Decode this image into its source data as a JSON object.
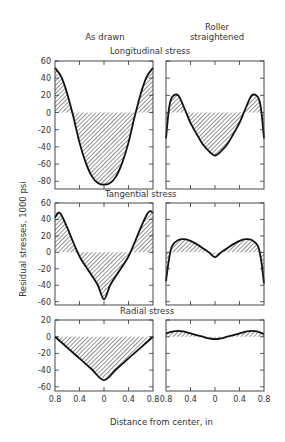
{
  "headers": {
    "left_column": "As drawn",
    "right_column_line1": "Roller",
    "right_column_line2": "straightened"
  },
  "xlabel": "Distance from center, in",
  "ylabel": "Residual stresses, 1000 psi",
  "colors": {
    "line": "#111111",
    "hatch": "#555555",
    "frame": "#333333",
    "text": "#333333"
  },
  "chart_data": {
    "type": "line",
    "title": "",
    "xlabel": "Distance from center, in",
    "ylabel": "Residual stresses, 1000 psi",
    "x_ticks": [
      "0.8",
      "0.4",
      "0",
      "0.4",
      "0.8"
    ],
    "x": [
      -0.8,
      -0.6,
      -0.4,
      -0.2,
      0,
      0.2,
      0.4,
      0.6,
      0.8
    ],
    "columns": [
      "As drawn",
      "Roller straightened"
    ],
    "panels": [
      {
        "title": "Longitudinal stress",
        "ylim": [
          -90,
          60
        ],
        "yticks": [
          60,
          40,
          20,
          0,
          -20,
          -40,
          -60,
          -80
        ],
        "series": [
          {
            "name": "As drawn",
            "x": [
              -0.8,
              -0.7,
              -0.6,
              -0.5,
              -0.4,
              -0.3,
              -0.2,
              -0.1,
              0,
              0.1,
              0.2,
              0.3,
              0.4,
              0.5,
              0.6,
              0.7,
              0.8
            ],
            "values": [
              52,
              42,
              22,
              -5,
              -35,
              -58,
              -74,
              -82,
              -84,
              -82,
              -74,
              -58,
              -35,
              -5,
              22,
              42,
              52
            ]
          },
          {
            "name": "Roller straightened",
            "x": [
              -0.8,
              -0.75,
              -0.7,
              -0.6,
              -0.5,
              -0.4,
              -0.3,
              -0.2,
              -0.1,
              0,
              0.1,
              0.2,
              0.3,
              0.4,
              0.5,
              0.6,
              0.7,
              0.75,
              0.8
            ],
            "values": [
              -30,
              5,
              18,
              20,
              5,
              -12,
              -25,
              -37,
              -45,
              -50,
              -45,
              -37,
              -25,
              -12,
              5,
              20,
              18,
              5,
              -30
            ]
          }
        ]
      },
      {
        "title": "Tangential stress",
        "ylim": [
          -65,
          60
        ],
        "yticks": [
          60,
          40,
          20,
          0,
          -20,
          -40,
          -60
        ],
        "series": [
          {
            "name": "As drawn",
            "x": [
              -0.8,
              -0.75,
              -0.7,
              -0.6,
              -0.5,
              -0.4,
              -0.3,
              -0.2,
              -0.1,
              0,
              0.1,
              0.2,
              0.3,
              0.4,
              0.5,
              0.6,
              0.7,
              0.75,
              0.8
            ],
            "values": [
              42,
              48,
              46,
              30,
              12,
              -5,
              -17,
              -28,
              -40,
              -57,
              -40,
              -28,
              -17,
              -5,
              12,
              30,
              46,
              50,
              48
            ]
          },
          {
            "name": "Roller straightened",
            "x": [
              -0.8,
              -0.75,
              -0.7,
              -0.6,
              -0.5,
              -0.4,
              -0.3,
              -0.2,
              -0.1,
              0,
              0.1,
              0.2,
              0.3,
              0.4,
              0.5,
              0.6,
              0.7,
              0.75,
              0.8
            ],
            "values": [
              -35,
              -8,
              8,
              15,
              16,
              14,
              10,
              5,
              0,
              -6,
              0,
              5,
              10,
              14,
              16,
              15,
              8,
              -8,
              -38
            ]
          }
        ]
      },
      {
        "title": "Radial stress",
        "ylim": [
          -65,
          20
        ],
        "yticks": [
          20,
          0,
          -20,
          -40,
          -60
        ],
        "series": [
          {
            "name": "As drawn",
            "x": [
              -0.8,
              -0.6,
              -0.4,
              -0.2,
              0,
              0.2,
              0.4,
              0.6,
              0.8
            ],
            "values": [
              0,
              -13,
              -26,
              -39,
              -52,
              -39,
              -26,
              -13,
              0
            ]
          },
          {
            "name": "Roller straightened",
            "x": [
              -0.8,
              -0.7,
              -0.6,
              -0.5,
              -0.4,
              -0.3,
              -0.2,
              -0.1,
              0,
              0.1,
              0.2,
              0.3,
              0.4,
              0.5,
              0.6,
              0.7,
              0.8
            ],
            "values": [
              4,
              6,
              7,
              6,
              4,
              2,
              0,
              -2,
              -3,
              -2,
              0,
              2,
              4,
              6,
              7,
              6,
              3
            ]
          }
        ]
      }
    ]
  }
}
